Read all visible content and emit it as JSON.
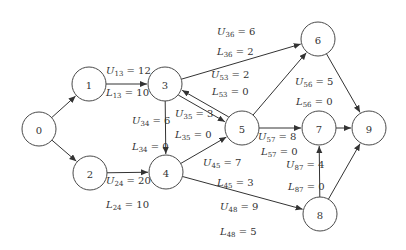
{
  "diagram": {
    "type": "directed-network",
    "nodes": [
      {
        "id": "0",
        "label": "0",
        "x": 39,
        "y": 129
      },
      {
        "id": "1",
        "label": "1",
        "x": 89,
        "y": 84
      },
      {
        "id": "2",
        "label": "2",
        "x": 90,
        "y": 173
      },
      {
        "id": "3",
        "label": "3",
        "x": 165,
        "y": 84
      },
      {
        "id": "4",
        "label": "4",
        "x": 166,
        "y": 172
      },
      {
        "id": "5",
        "label": "5",
        "x": 242,
        "y": 128
      },
      {
        "id": "6",
        "label": "6",
        "x": 318,
        "y": 39
      },
      {
        "id": "7",
        "label": "7",
        "x": 319,
        "y": 128
      },
      {
        "id": "8",
        "label": "8",
        "x": 320,
        "y": 214
      },
      {
        "id": "9",
        "label": "9",
        "x": 369,
        "y": 128
      }
    ],
    "edges": [
      {
        "from": "0",
        "to": "1"
      },
      {
        "from": "0",
        "to": "2"
      },
      {
        "from": "1",
        "to": "3",
        "U": "12",
        "L": "10"
      },
      {
        "from": "2",
        "to": "4",
        "U": "20",
        "L": "10"
      },
      {
        "from": "3",
        "to": "4",
        "U": "6",
        "L": "0"
      },
      {
        "from": "3",
        "to": "5",
        "U": "3",
        "L": "0"
      },
      {
        "from": "5",
        "to": "3",
        "U": "2",
        "L": "0"
      },
      {
        "from": "3",
        "to": "6",
        "U": "6",
        "L": "2"
      },
      {
        "from": "4",
        "to": "5",
        "U": "7",
        "L": "3"
      },
      {
        "from": "4",
        "to": "8",
        "U": "9",
        "L": "5"
      },
      {
        "from": "5",
        "to": "6",
        "U": "5",
        "L": "0"
      },
      {
        "from": "5",
        "to": "7",
        "U": "8",
        "L": "0"
      },
      {
        "from": "8",
        "to": "7",
        "U": "4",
        "L": "0"
      },
      {
        "from": "6",
        "to": "9"
      },
      {
        "from": "7",
        "to": "9"
      },
      {
        "from": "8",
        "to": "9"
      }
    ]
  },
  "labels": {
    "U13": {
      "sym": "U",
      "sub": "13",
      "val": " = 12"
    },
    "L13": {
      "sym": "L",
      "sub": "13",
      "val": " = 10"
    },
    "U24": {
      "sym": "U",
      "sub": "24",
      "val": " = 20"
    },
    "L24": {
      "sym": "L",
      "sub": "24",
      "val": " = 10"
    },
    "U34": {
      "sym": "U",
      "sub": "34",
      "val": " = 6"
    },
    "L34": {
      "sym": "L",
      "sub": "34",
      "val": " = 0"
    },
    "U35": {
      "sym": "U",
      "sub": "35",
      "val": " = 3"
    },
    "L35": {
      "sym": "L",
      "sub": "35",
      "val": " = 0"
    },
    "U53": {
      "sym": "U",
      "sub": "53",
      "val": " = 2"
    },
    "L53": {
      "sym": "L",
      "sub": "53",
      "val": " = 0"
    },
    "U36": {
      "sym": "U",
      "sub": "36",
      "val": " = 6"
    },
    "L36": {
      "sym": "L",
      "sub": "36",
      "val": " = 2"
    },
    "U45": {
      "sym": "U",
      "sub": "45",
      "val": " = 7"
    },
    "L45": {
      "sym": "L",
      "sub": "45",
      "val": " = 3"
    },
    "U48": {
      "sym": "U",
      "sub": "48",
      "val": " = 9"
    },
    "L48": {
      "sym": "L",
      "sub": "48",
      "val": " = 5"
    },
    "U56": {
      "sym": "U",
      "sub": "56",
      "val": " = 5"
    },
    "L56": {
      "sym": "L",
      "sub": "56",
      "val": " = 0"
    },
    "U57": {
      "sym": "U",
      "sub": "57",
      "val": " = 8"
    },
    "L57": {
      "sym": "L",
      "sub": "57",
      "val": " = 0"
    },
    "U87": {
      "sym": "U",
      "sub": "87",
      "val": " = 4"
    },
    "L87": {
      "sym": "L",
      "sub": "87",
      "val": " = 0"
    }
  }
}
